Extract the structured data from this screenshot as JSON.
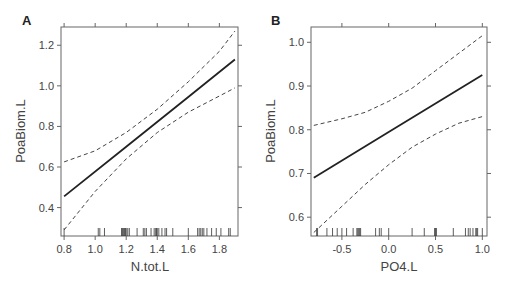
{
  "chart_data": [
    {
      "type": "line",
      "panel_label": "A",
      "xlabel": "N.tot.L",
      "ylabel": "PoaBiom.L",
      "xlim": [
        0.78,
        1.92
      ],
      "ylim": [
        0.26,
        1.29
      ],
      "xticks": [
        0.8,
        1.0,
        1.2,
        1.4,
        1.6,
        1.8
      ],
      "xtick_labels": [
        "0.8",
        "1.0",
        "1.2",
        "1.4",
        "1.6",
        "1.8"
      ],
      "yticks": [
        0.4,
        0.6,
        0.8,
        1.0,
        1.2
      ],
      "ytick_labels": [
        "0.4",
        "0.6",
        "0.8",
        "1.0",
        "1.2"
      ],
      "grid": false,
      "series": [
        {
          "name": "fit",
          "style": "solid",
          "x": [
            0.8,
            1.2,
            1.6,
            1.9
          ],
          "y": [
            0.455,
            0.7,
            0.945,
            1.13
          ]
        },
        {
          "name": "upper CI",
          "style": "dashed",
          "x": [
            0.8,
            1.0,
            1.2,
            1.4,
            1.6,
            1.8,
            1.9
          ],
          "y": [
            0.625,
            0.68,
            0.77,
            0.885,
            1.02,
            1.17,
            1.27
          ]
        },
        {
          "name": "lower CI",
          "style": "dashed",
          "x": [
            0.8,
            1.0,
            1.2,
            1.4,
            1.6,
            1.8,
            1.9
          ],
          "y": [
            0.29,
            0.48,
            0.64,
            0.77,
            0.87,
            0.95,
            0.99
          ]
        }
      ],
      "rug": [
        0.8,
        1.02,
        1.03,
        1.06,
        1.17,
        1.175,
        1.18,
        1.185,
        1.19,
        1.195,
        1.2,
        1.21,
        1.22,
        1.27,
        1.31,
        1.32,
        1.33,
        1.36,
        1.38,
        1.39,
        1.395,
        1.4,
        1.41,
        1.43,
        1.45,
        1.46,
        1.5,
        1.6,
        1.66,
        1.67,
        1.68,
        1.69,
        1.7,
        1.72,
        1.75,
        1.78,
        1.81,
        1.86,
        1.87
      ]
    },
    {
      "type": "line",
      "panel_label": "B",
      "xlabel": "PO4.L",
      "ylabel": "PoaBiom.L",
      "xlim": [
        -0.83,
        1.05
      ],
      "ylim": [
        0.557,
        1.035
      ],
      "xticks": [
        -0.5,
        0.0,
        0.5,
        1.0
      ],
      "xtick_labels": [
        "-0.5",
        "0.0",
        "0.5",
        "1.0"
      ],
      "yticks": [
        0.6,
        0.7,
        0.8,
        0.9,
        1.0
      ],
      "ytick_labels": [
        "0.6",
        "0.7",
        "0.8",
        "0.9",
        "1.0"
      ],
      "grid": false,
      "series": [
        {
          "name": "fit",
          "style": "solid",
          "x": [
            -0.8,
            0.0,
            1.0
          ],
          "y": [
            0.69,
            0.795,
            0.925
          ]
        },
        {
          "name": "upper CI",
          "style": "dashed",
          "x": [
            -0.8,
            -0.5,
            -0.25,
            0.0,
            0.25,
            0.5,
            0.75,
            1.0
          ],
          "y": [
            0.81,
            0.825,
            0.84,
            0.865,
            0.895,
            0.935,
            0.975,
            1.015
          ]
        },
        {
          "name": "lower CI",
          "style": "dashed",
          "x": [
            -0.8,
            -0.5,
            -0.25,
            0.0,
            0.25,
            0.5,
            0.75,
            1.0
          ],
          "y": [
            0.565,
            0.625,
            0.675,
            0.72,
            0.76,
            0.79,
            0.815,
            0.83
          ]
        }
      ],
      "rug": [
        -0.77,
        -0.76,
        -0.66,
        -0.6,
        -0.55,
        -0.5,
        -0.45,
        -0.38,
        -0.34,
        -0.33,
        -0.32,
        -0.31,
        -0.3,
        -0.14,
        -0.1,
        -0.08,
        0.0,
        0.25,
        0.38,
        0.49,
        0.5,
        0.51,
        0.69,
        0.82,
        0.85,
        0.87,
        0.9,
        0.93,
        0.94,
        0.95,
        1.0
      ]
    }
  ]
}
